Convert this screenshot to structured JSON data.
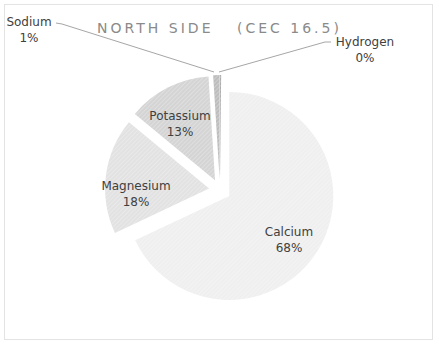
{
  "chart_data": {
    "type": "pie",
    "title": "NORTH SIDE",
    "subtitle": "(CEC 16.5)",
    "categories": [
      "Calcium",
      "Magnesium",
      "Potassium",
      "Sodium",
      "Hydrogen"
    ],
    "values": [
      68,
      18,
      13,
      1,
      0
    ],
    "value_labels": [
      "68%",
      "18%",
      "13%",
      "1%",
      "0%"
    ],
    "exploded": true,
    "legend": "none",
    "data_labels": "category and percentage"
  },
  "labels": {
    "calcium": {
      "name": "Calcium",
      "pct": "68%"
    },
    "magnesium": {
      "name": "Magnesium",
      "pct": "18%"
    },
    "potassium": {
      "name": "Potassium",
      "pct": "13%"
    },
    "sodium": {
      "name": "Sodium",
      "pct": "1%"
    },
    "hydrogen": {
      "name": "Hydrogen",
      "pct": "0%"
    }
  },
  "colors": {
    "calcium": "#efefef",
    "magnesium": "#e2e2e2",
    "potassium": "#d4d4d4",
    "sodium": "#bdbdbd",
    "hydrogen": "#a8a8a8"
  }
}
